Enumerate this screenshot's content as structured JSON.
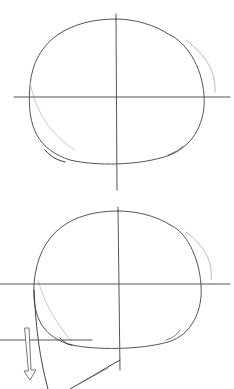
{
  "image": {
    "subject": "pencil sketch of head construction",
    "panels": [
      {
        "id": "top",
        "description": "circle with vertical and horizontal center guide lines"
      },
      {
        "id": "bottom",
        "description": "circle with guide lines, jaw line and downward arrow"
      }
    ],
    "colors": {
      "background": "#ffffff",
      "stroke_dark": "#555555",
      "stroke_light": "#aaaaaa"
    }
  }
}
